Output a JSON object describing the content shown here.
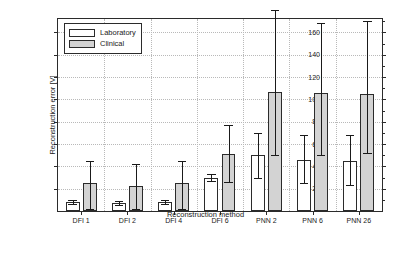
{
  "chart_data": {
    "type": "bar",
    "title": "",
    "xlabel": "Reconstruction method",
    "ylabel": "Reconstruction error [V]",
    "categories": [
      "DFI 1",
      "DFI 2",
      "DFI 4",
      "DFI 6",
      "PNN 2",
      "PNN 6",
      "PNN 26"
    ],
    "ylim": [
      0,
      172
    ],
    "yticks": [
      20,
      40,
      60,
      80,
      100,
      120,
      140,
      160
    ],
    "grid": true,
    "legend_position": "upper-left",
    "series": [
      {
        "name": "Laboratory",
        "color": "#ffffff",
        "values": [
          8,
          7,
          8,
          30,
          50,
          46,
          45
        ],
        "err_low": [
          6,
          5,
          6,
          27,
          30,
          25,
          23
        ],
        "err_high": [
          10,
          9,
          10,
          33,
          70,
          68,
          68
        ]
      },
      {
        "name": "Clinical",
        "color": "#d3d3d3",
        "values": [
          25,
          22,
          25,
          51,
          107,
          106,
          105
        ],
        "err_low": [
          2,
          2,
          2,
          26,
          50,
          50,
          52
        ],
        "err_high": [
          45,
          42,
          45,
          77,
          180,
          168,
          170
        ]
      }
    ]
  },
  "legend": {
    "entries": [
      {
        "label": "Laboratory"
      },
      {
        "label": "Clinical"
      }
    ]
  }
}
